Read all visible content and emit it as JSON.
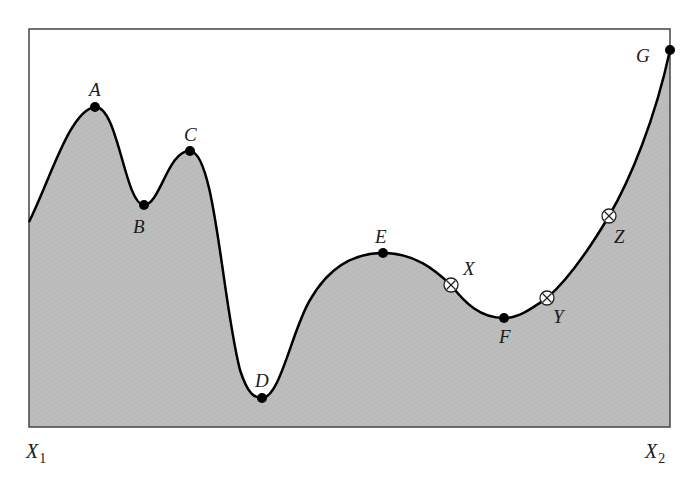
{
  "diagram": {
    "type": "fitness-landscape",
    "frame": {
      "left": 29,
      "top": 29,
      "right": 670,
      "bottom": 427
    },
    "colors": {
      "fill": "#bcbcbc",
      "curve": "#000000",
      "frame": "#444444",
      "background": "#ffffff"
    },
    "axis_labels": {
      "left": {
        "main": "X",
        "sub": "1"
      },
      "right": {
        "main": "X",
        "sub": "2"
      }
    },
    "extrema_points": [
      {
        "label": "A",
        "x": 95,
        "y": 107,
        "kind": "maximum"
      },
      {
        "label": "B",
        "x": 144,
        "y": 205,
        "kind": "minimum"
      },
      {
        "label": "C",
        "x": 190,
        "y": 151,
        "kind": "maximum"
      },
      {
        "label": "D",
        "x": 262,
        "y": 398,
        "kind": "minimum"
      },
      {
        "label": "E",
        "x": 383,
        "y": 253,
        "kind": "maximum"
      },
      {
        "label": "F",
        "x": 504,
        "y": 318,
        "kind": "minimum"
      },
      {
        "label": "G",
        "x": 670,
        "y": 50,
        "kind": "maximum"
      }
    ],
    "marked_points": [
      {
        "label": "X",
        "x": 451,
        "y": 285,
        "symbol": "circle-times"
      },
      {
        "label": "Y",
        "x": 547,
        "y": 298,
        "symbol": "circle-times"
      },
      {
        "label": "Z",
        "x": 609,
        "y": 216,
        "symbol": "circle-times"
      }
    ]
  }
}
